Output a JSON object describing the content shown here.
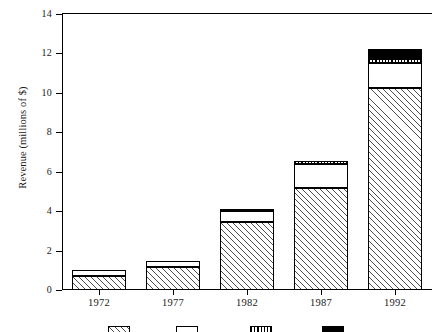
{
  "chart_data": {
    "type": "bar",
    "subtype": "stacked-bar",
    "title": "",
    "xlabel": "",
    "ylabel": "Revenue (millions of $)",
    "categories": [
      "1972",
      "1977",
      "1982",
      "1987",
      "1992"
    ],
    "ylim": [
      0,
      14
    ],
    "ytick_labels": [
      "0",
      "2",
      "4",
      "6",
      "8",
      "10",
      "12",
      "14"
    ],
    "ytick_values": [
      0,
      2,
      4,
      6,
      8,
      10,
      12,
      14
    ],
    "grid": false,
    "legend_position": "bottom",
    "series": [
      {
        "name": "series-1",
        "pattern": "diagonal-hatch",
        "color": "#ffffff",
        "values": [
          0.72,
          1.18,
          3.45,
          5.15,
          10.25
        ]
      },
      {
        "name": "series-2",
        "pattern": "solid-white",
        "color": "#ffffff",
        "values": [
          0.28,
          0.3,
          0.55,
          1.25,
          1.25
        ]
      },
      {
        "name": "series-3",
        "pattern": "dotted-band",
        "color": "#ffffff",
        "values": [
          0.0,
          0.0,
          0.12,
          0.15,
          0.22
        ]
      },
      {
        "name": "series-4",
        "pattern": "solid-black",
        "color": "#000000",
        "values": [
          0.0,
          0.0,
          0.0,
          0.0,
          0.48
        ]
      }
    ],
    "totals": [
      1.0,
      1.48,
      4.12,
      6.55,
      12.2
    ]
  },
  "legend": {
    "note": "swatches cropped at bottom edge of image; labels not visible",
    "items": [
      {
        "label": "",
        "pattern": "diagonal-hatch"
      },
      {
        "label": "",
        "pattern": "solid-white"
      },
      {
        "label": "",
        "pattern": "dotted-band"
      },
      {
        "label": "",
        "pattern": "solid-black"
      }
    ]
  }
}
